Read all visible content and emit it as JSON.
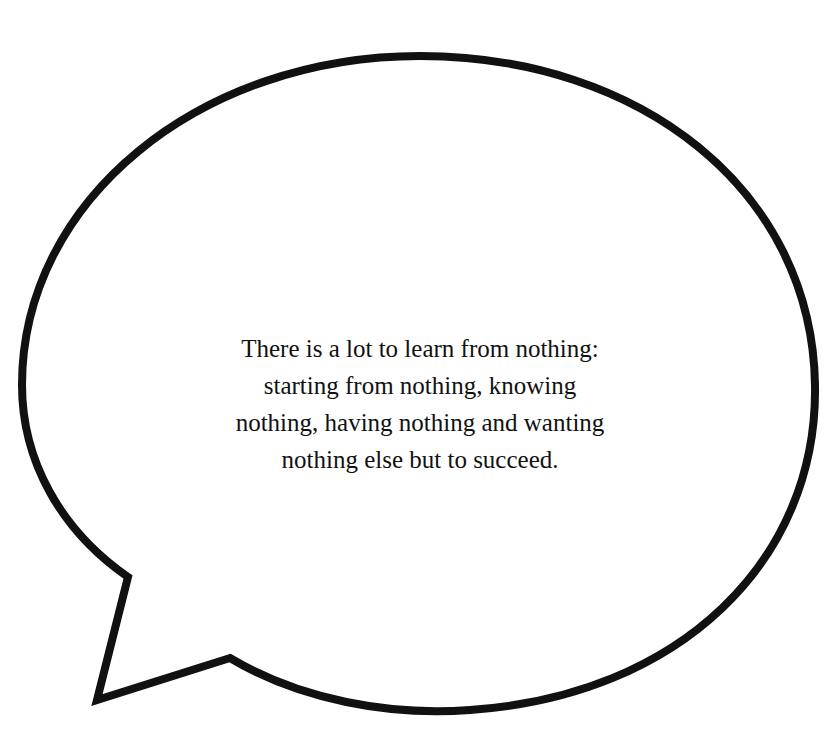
{
  "bubble": {
    "stroke_color": "#111111",
    "fill_color": "#ffffff"
  },
  "quote": {
    "lines": [
      "There is a lot to learn from nothing:",
      "starting from nothing, knowing",
      "nothing, having nothing and wanting",
      "nothing else but to succeed."
    ]
  }
}
